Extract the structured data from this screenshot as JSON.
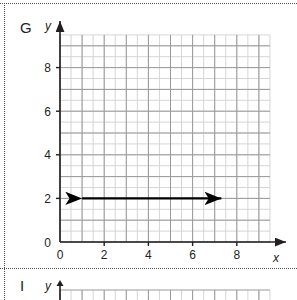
{
  "page": {
    "background_color": "#ffffff",
    "frame_color": "#4d4d4d"
  },
  "panels": [
    {
      "letter": "G",
      "y_axis_label": "y",
      "x_axis_label": "x"
    },
    {
      "letter": "I",
      "y_axis_label": "y",
      "x_axis_label": "x"
    }
  ],
  "chart_data": {
    "type": "line",
    "title": "",
    "panel_letter": "G",
    "xlabel": "x",
    "ylabel": "y",
    "xlim": [
      0,
      9.5
    ],
    "ylim": [
      0,
      9.5
    ],
    "xticks": [
      0,
      2,
      4,
      6,
      8
    ],
    "yticks": [
      0,
      2,
      4,
      6,
      8
    ],
    "xtick_labels": [
      "0",
      "2",
      "4",
      "6",
      "8"
    ],
    "ytick_labels": [
      "0",
      "2",
      "4",
      "6",
      "8"
    ],
    "grid": true,
    "grid_major_step": 1,
    "grid_minor_step": 0.5,
    "grid_major_color": "#9a9a9a",
    "grid_minor_color": "#d6d6d6",
    "axis_color": "#231f20",
    "legend": false,
    "series": [
      {
        "name": "y = 2",
        "type": "segment-double-arrow",
        "color": "#000000",
        "x": [
          1.0,
          7.3
        ],
        "y": [
          2.0,
          2.0
        ],
        "arrow_start": true,
        "arrow_end": true,
        "equation": "y = 2"
      }
    ],
    "annotations": []
  }
}
